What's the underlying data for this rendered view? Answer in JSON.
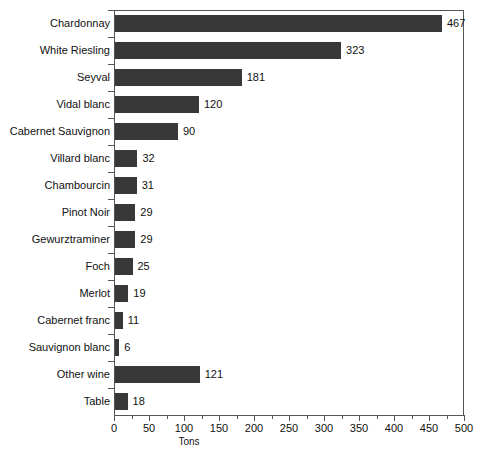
{
  "chart_data": {
    "type": "bar",
    "orientation": "horizontal",
    "title": "",
    "xlabel": "Tons",
    "ylabel": "",
    "xlim": [
      0,
      500
    ],
    "xticks": [
      0,
      50,
      100,
      150,
      200,
      250,
      300,
      350,
      400,
      450,
      500
    ],
    "xtick_labels": [
      "0",
      "50",
      "100",
      "150",
      "200",
      "250",
      "300",
      "350",
      "400",
      "450",
      "500"
    ],
    "minor_tick_step": 25,
    "grid": false,
    "legend": null,
    "bar_color": "#383838",
    "axis_color": "#555555",
    "value_labels_shown": true,
    "categories": [
      "Chardonnay",
      "White Riesling",
      "Seyval",
      "Vidal blanc",
      "Cabernet Sauvignon",
      "Villard blanc",
      "Chambourcin",
      "Pinot Noir",
      "Gewurztraminer",
      "Foch",
      "Merlot",
      "Cabernet franc",
      "Sauvignon blanc",
      "Other wine",
      "Table"
    ],
    "values": [
      467,
      323,
      181,
      120,
      90,
      32,
      31,
      29,
      29,
      25,
      19,
      11,
      6,
      121,
      18
    ],
    "value_labels": [
      "467",
      "323",
      "181",
      "120",
      "90",
      "32",
      "31",
      "29",
      "29",
      "25",
      "19",
      "11",
      "6",
      "121",
      "18"
    ]
  }
}
